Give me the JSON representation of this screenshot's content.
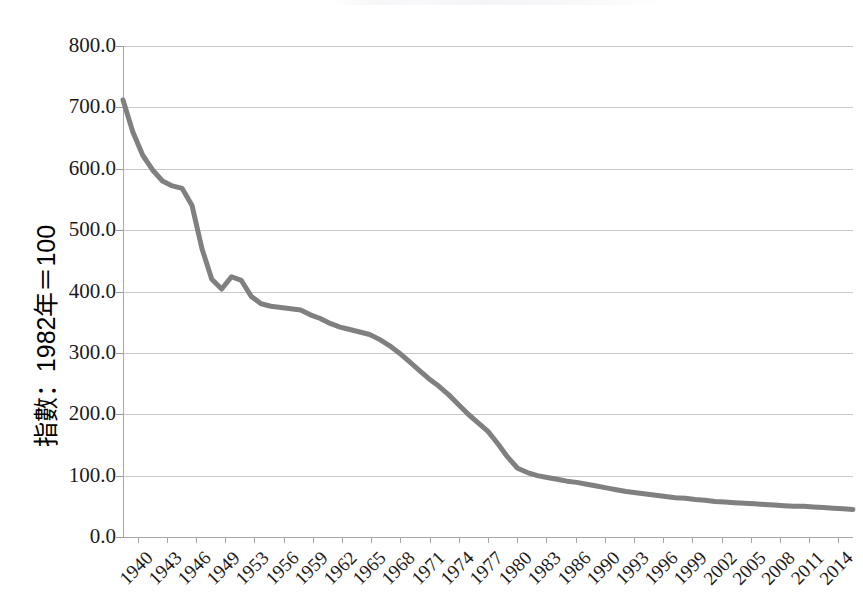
{
  "chart_data": {
    "type": "line",
    "title": "",
    "xlabel": "",
    "ylabel": "指數：1982年＝100",
    "ylim": [
      0,
      800
    ],
    "ytick_labels": [
      "0.0",
      "100.0",
      "200.0",
      "300.0",
      "400.0",
      "500.0",
      "600.0",
      "700.0",
      "800.0"
    ],
    "ytick_values": [
      0,
      100,
      200,
      300,
      400,
      500,
      600,
      700,
      800
    ],
    "xtick_labels": [
      "1940",
      "1943",
      "1946",
      "1949",
      "1953",
      "1956",
      "1959",
      "1962",
      "1965",
      "1968",
      "1971",
      "1974",
      "1977",
      "1980",
      "1983",
      "1986",
      "1990",
      "1993",
      "1996",
      "1999",
      "2002",
      "2005",
      "2008",
      "2011",
      "2014"
    ],
    "xlim": [
      1940,
      2014
    ],
    "grid": "horizontal",
    "legend": "none",
    "series": [
      {
        "name": "指數",
        "color": "#808080",
        "line_width": 5,
        "x": [
          1940,
          1941,
          1942,
          1943,
          1944,
          1945,
          1946,
          1947,
          1948,
          1949,
          1950,
          1951,
          1952,
          1953,
          1954,
          1955,
          1956,
          1957,
          1958,
          1959,
          1960,
          1961,
          1962,
          1963,
          1964,
          1965,
          1966,
          1967,
          1968,
          1969,
          1970,
          1971,
          1972,
          1973,
          1974,
          1975,
          1976,
          1977,
          1978,
          1979,
          1980,
          1981,
          1982,
          1983,
          1984,
          1985,
          1986,
          1987,
          1988,
          1989,
          1990,
          1991,
          1992,
          1993,
          1994,
          1995,
          1996,
          1997,
          1998,
          1999,
          2000,
          2001,
          2002,
          2003,
          2004,
          2005,
          2006,
          2007,
          2008,
          2009,
          2010,
          2011,
          2012,
          2013,
          2014
        ],
        "values": [
          712,
          660,
          622,
          598,
          580,
          572,
          568,
          540,
          470,
          420,
          404,
          424,
          418,
          392,
          380,
          376,
          374,
          372,
          370,
          362,
          356,
          348,
          342,
          338,
          334,
          330,
          322,
          312,
          300,
          286,
          272,
          258,
          246,
          232,
          216,
          200,
          186,
          172,
          152,
          130,
          112,
          105,
          100,
          97,
          94,
          91,
          89,
          86,
          83,
          80,
          77,
          74,
          72,
          70,
          68,
          66,
          64,
          63,
          61,
          60,
          58,
          57,
          56,
          55,
          54,
          53,
          52,
          51,
          50,
          50,
          49,
          48,
          47,
          46,
          45
        ]
      }
    ]
  },
  "axis": {
    "y_axis_name": "y-axis",
    "x_axis_name": "x-axis"
  }
}
